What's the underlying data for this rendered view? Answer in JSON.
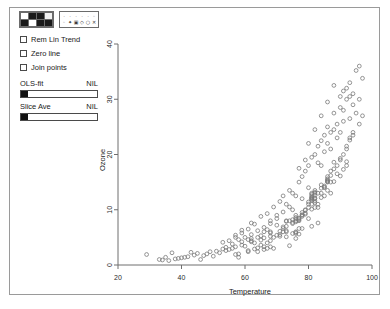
{
  "window": {
    "title": ""
  },
  "controls": {
    "color_palette": {
      "name": "color-palette",
      "swatches": [
        "#ffffff",
        "#1a1a1a",
        "#1a1a1a",
        "#f2f2f2",
        "#1a1a1a",
        "#ffffff",
        "#1a1a1a",
        "#1a1a1a"
      ]
    },
    "symbol_palette": {
      "name": "symbol-palette",
      "symbols": [
        "·",
        "·",
        "·",
        "·",
        "·",
        "◦",
        "◦",
        "✦",
        "▣",
        "◇",
        "○",
        "✕"
      ]
    },
    "checkboxes": [
      {
        "id": "rem-lin-trend",
        "label": "Rem Lin Trend",
        "checked": false
      },
      {
        "id": "zero-line",
        "label": "Zero line",
        "checked": false
      },
      {
        "id": "join-points",
        "label": "Join points",
        "checked": false
      }
    ],
    "sliders": [
      {
        "id": "ols-fit",
        "label": "OLS-fit",
        "value": "NIL",
        "position": 0
      },
      {
        "id": "slice-ave",
        "label": "Slice Ave",
        "value": "NIL",
        "position": 0
      }
    ]
  },
  "chart_data": {
    "type": "scatter",
    "title": "",
    "xlabel": "Temperature",
    "ylabel": "Ozone",
    "xlim": [
      20,
      100
    ],
    "ylim": [
      0,
      40
    ],
    "xticks": [
      20,
      40,
      60,
      80,
      100
    ],
    "yticks": [
      0,
      10,
      20,
      30,
      40
    ],
    "grid": false,
    "legend": null,
    "marker": "open-circle",
    "marker_color": "#7a7a7a",
    "series": [
      {
        "name": "Ozone vs Temperature",
        "points": [
          [
            67,
            6.4
          ],
          [
            72,
            6.0
          ],
          [
            74,
            3.5
          ],
          [
            62,
            4.2
          ],
          [
            65,
            5.3
          ],
          [
            59,
            4.2
          ],
          [
            61,
            4.6
          ],
          [
            69,
            3.0
          ],
          [
            66,
            3.3
          ],
          [
            68,
            6.0
          ],
          [
            58,
            1.4
          ],
          [
            64,
            2.4
          ],
          [
            66,
            2.8
          ],
          [
            57,
            3.3
          ],
          [
            68,
            3.3
          ],
          [
            62,
            4.8
          ],
          [
            59,
            3.6
          ],
          [
            73,
            7.0
          ],
          [
            61,
            2.6
          ],
          [
            61,
            2.4
          ],
          [
            67,
            3.0
          ],
          [
            81,
            7.0
          ],
          [
            79,
            9.2
          ],
          [
            76,
            8.6
          ],
          [
            82,
            10.4
          ],
          [
            90,
            16.1
          ],
          [
            87,
            13.0
          ],
          [
            82,
            11.3
          ],
          [
            77,
            8.5
          ],
          [
            72,
            6.9
          ],
          [
            65,
            3.6
          ],
          [
            73,
            5.1
          ],
          [
            76,
            5.9
          ],
          [
            77,
            6.6
          ],
          [
            76,
            5.7
          ],
          [
            76,
            4.8
          ],
          [
            76,
            6.0
          ],
          [
            75,
            5.7
          ],
          [
            78,
            6.6
          ],
          [
            73,
            6.0
          ],
          [
            80,
            8.4
          ],
          [
            77,
            5.6
          ],
          [
            83,
            7.6
          ],
          [
            84,
            12.2
          ],
          [
            85,
            12.5
          ],
          [
            81,
            11.0
          ],
          [
            84,
            13.0
          ],
          [
            83,
            10.4
          ],
          [
            83,
            11.0
          ],
          [
            88,
            15.1
          ],
          [
            92,
            18.0
          ],
          [
            92,
            18.7
          ],
          [
            89,
            16.5
          ],
          [
            82,
            13.2
          ],
          [
            73,
            7.9
          ],
          [
            81,
            12.8
          ],
          [
            91,
            17.3
          ],
          [
            80,
            11.4
          ],
          [
            81,
            12.2
          ],
          [
            82,
            13.0
          ],
          [
            84,
            13.9
          ],
          [
            87,
            15.0
          ],
          [
            85,
            14.1
          ],
          [
            74,
            8.0
          ],
          [
            81,
            10.1
          ],
          [
            82,
            11.6
          ],
          [
            86,
            13.5
          ],
          [
            85,
            14.3
          ],
          [
            82,
            12.0
          ],
          [
            86,
            15.2
          ],
          [
            88,
            17.4
          ],
          [
            86,
            15.6
          ],
          [
            83,
            13.0
          ],
          [
            81,
            11.7
          ],
          [
            81,
            12.2
          ],
          [
            81,
            12.0
          ],
          [
            82,
            12.6
          ],
          [
            86,
            15.0
          ],
          [
            85,
            14.0
          ],
          [
            87,
            16.2
          ],
          [
            89,
            18.0
          ],
          [
            90,
            19.3
          ],
          [
            90,
            19.0
          ],
          [
            92,
            21.5
          ],
          [
            86,
            15.4
          ],
          [
            86,
            15.1
          ],
          [
            82,
            12.1
          ],
          [
            80,
            10.4
          ],
          [
            79,
            9.4
          ],
          [
            77,
            8.0
          ],
          [
            79,
            9.9
          ],
          [
            76,
            7.8
          ],
          [
            78,
            8.8
          ],
          [
            78,
            9.0
          ],
          [
            77,
            8.4
          ],
          [
            72,
            6.6
          ],
          [
            75,
            7.7
          ],
          [
            79,
            10.0
          ],
          [
            81,
            11.9
          ],
          [
            86,
            16.0
          ],
          [
            88,
            18.6
          ],
          [
            97,
            27.0
          ],
          [
            94,
            24.0
          ],
          [
            96,
            25.5
          ],
          [
            94,
            23.5
          ],
          [
            91,
            20.0
          ],
          [
            92,
            21.0
          ],
          [
            93,
            22.6
          ],
          [
            93,
            23.0
          ],
          [
            87,
            17.0
          ],
          [
            84,
            14.5
          ],
          [
            80,
            11.0
          ],
          [
            78,
            9.5
          ],
          [
            75,
            7.5
          ],
          [
            73,
            6.2
          ],
          [
            81,
            12.5
          ],
          [
            76,
            8.0
          ],
          [
            77,
            8.2
          ],
          [
            71,
            5.5
          ],
          [
            71,
            5.2
          ],
          [
            78,
            9.1
          ],
          [
            67,
            4.0
          ],
          [
            76,
            8.3
          ],
          [
            68,
            4.4
          ],
          [
            82,
            13.5
          ],
          [
            64,
            3.1
          ],
          [
            71,
            6.1
          ],
          [
            81,
            13.0
          ],
          [
            69,
            5.0
          ],
          [
            63,
            2.9
          ],
          [
            70,
            5.4
          ],
          [
            75,
            8.2
          ],
          [
            76,
            9.0
          ],
          [
            68,
            5.8
          ],
          [
            65,
            4.5
          ],
          [
            58,
            2.0
          ],
          [
            66,
            4.9
          ],
          [
            57,
            1.9
          ],
          [
            68,
            5.2
          ],
          [
            97,
            33.8
          ],
          [
            94,
            31.0
          ],
          [
            91,
            28.0
          ],
          [
            92,
            30.0
          ],
          [
            93,
            30.5
          ],
          [
            87,
            21.0
          ],
          [
            84,
            18.0
          ],
          [
            80,
            14.0
          ],
          [
            78,
            12.0
          ],
          [
            75,
            10.0
          ],
          [
            73,
            8.0
          ],
          [
            85,
            20.5
          ],
          [
            83,
            18.5
          ],
          [
            89,
            25.5
          ],
          [
            90,
            28.5
          ],
          [
            86,
            22.0
          ],
          [
            88,
            24.5
          ],
          [
            96,
            36.0
          ],
          [
            95,
            35.2
          ],
          [
            93,
            33.0
          ],
          [
            91,
            31.5
          ],
          [
            36,
            0.8
          ],
          [
            42,
            1.5
          ],
          [
            46,
            1.0
          ],
          [
            39,
            1.2
          ],
          [
            44,
            1.8
          ],
          [
            52,
            2.2
          ],
          [
            50,
            1.6
          ],
          [
            48,
            2.0
          ],
          [
            54,
            2.6
          ],
          [
            56,
            3.0
          ],
          [
            38,
            1.1
          ],
          [
            41,
            1.4
          ],
          [
            45,
            2.1
          ],
          [
            49,
            2.4
          ],
          [
            53,
            2.9
          ],
          [
            29,
            1.9
          ],
          [
            33,
            1.0
          ],
          [
            35,
            1.4
          ],
          [
            43,
            2.3
          ],
          [
            47,
            1.7
          ],
          [
            51,
            2.5
          ],
          [
            55,
            2.8
          ],
          [
            37,
            2.2
          ],
          [
            40,
            1.3
          ],
          [
            34,
            0.9
          ],
          [
            60,
            3.4
          ],
          [
            63,
            4.0
          ],
          [
            56,
            3.8
          ],
          [
            58,
            4.6
          ],
          [
            54,
            3.2
          ],
          [
            60,
            5.0
          ],
          [
            62,
            5.5
          ],
          [
            64,
            6.2
          ],
          [
            66,
            6.8
          ],
          [
            70,
            7.2
          ],
          [
            62,
            7.6
          ],
          [
            59,
            6.3
          ],
          [
            57,
            5.4
          ],
          [
            55,
            4.4
          ],
          [
            53,
            4.1
          ],
          [
            67,
            9.3
          ],
          [
            69,
            10.5
          ],
          [
            71,
            11.5
          ],
          [
            74,
            13.5
          ],
          [
            72,
            12.5
          ],
          [
            65,
            8.8
          ],
          [
            63,
            7.4
          ],
          [
            61,
            6.5
          ],
          [
            59,
            5.8
          ],
          [
            57,
            5.0
          ],
          [
            88,
            27.5
          ],
          [
            90,
            30.5
          ],
          [
            92,
            32.0
          ],
          [
            86,
            25.0
          ],
          [
            84,
            22.5
          ],
          [
            81,
            19.5
          ],
          [
            79,
            17.0
          ],
          [
            77,
            15.0
          ],
          [
            75,
            13.0
          ],
          [
            73,
            11.0
          ],
          [
            91,
            26.0
          ],
          [
            89,
            23.0
          ],
          [
            87,
            24.0
          ],
          [
            85,
            23.5
          ],
          [
            83,
            21.5
          ],
          [
            94,
            29.0
          ],
          [
            96,
            30.0
          ],
          [
            95,
            27.5
          ],
          [
            93,
            26.5
          ],
          [
            90,
            24.0
          ],
          [
            70,
            9.0
          ],
          [
            68,
            7.5
          ],
          [
            66,
            6.0
          ],
          [
            64,
            5.0
          ],
          [
            62,
            4.4
          ],
          [
            79,
            19.0
          ],
          [
            77,
            17.5
          ],
          [
            82,
            20.0
          ],
          [
            80,
            18.0
          ],
          [
            78,
            16.0
          ],
          [
            84,
            27.0
          ],
          [
            82,
            24.5
          ],
          [
            86,
            29.5
          ],
          [
            88,
            32.5
          ],
          [
            80,
            22.0
          ],
          [
            74,
            10.5
          ],
          [
            76,
            12.5
          ],
          [
            72,
            9.6
          ],
          [
            70,
            8.4
          ],
          [
            68,
            8.0
          ]
        ]
      }
    ]
  }
}
